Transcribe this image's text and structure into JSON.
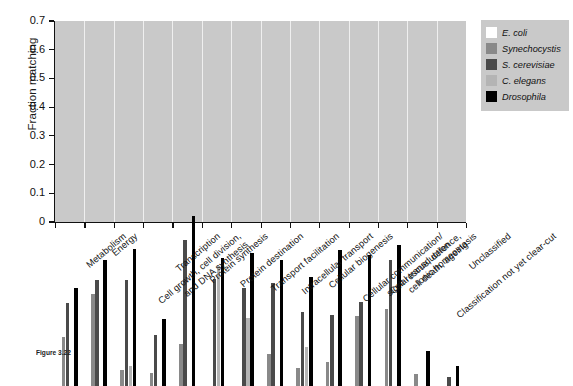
{
  "figure": {
    "caption_label": "Figure 3.22",
    "caption_text": ""
  },
  "legend": {
    "position": "top-right",
    "entries": [
      {
        "label": "E. coli",
        "color": "#ffffff"
      },
      {
        "label": "Synechocystis",
        "color": "#898989"
      },
      {
        "label": "S. cerevisiae",
        "color": "#4a4a4a"
      },
      {
        "label": "C. elegans",
        "color": "#b4b4b4"
      },
      {
        "label": "Drosophila",
        "color": "#000000"
      }
    ]
  },
  "chart_data": {
    "type": "bar",
    "title": "",
    "xlabel": "",
    "ylabel": "Fraction matching",
    "ylim": [
      0,
      0.7
    ],
    "yticks": [
      "0",
      "0.1",
      "0.2",
      "0.3",
      "0.4",
      "0.5",
      "0.6",
      "0.7"
    ],
    "grid": false,
    "legend_position": "top-right",
    "categories": [
      "Metabolism",
      "Energy",
      "Cell growth, cell division,\nand DNA synthesis",
      "Transcription",
      "Protein synthesis",
      "Protein destination",
      "Transport facilitation",
      "Intracellular transport",
      "Cellular biogenesis",
      "Cellular communication/\nsignal transduction",
      "Cell rescue, defence,\ncell death, ageing",
      "Ionic homeostasis",
      "Classification not yet clear-cut",
      "Unclassified"
    ],
    "series": [
      {
        "name": "E. coli",
        "color": "#ffffff",
        "values": [
          0.175,
          0.32,
          0.025,
          0.0,
          0.125,
          0.0,
          0.0,
          0.09,
          0.0,
          0.075,
          0.205,
          0.145,
          0.0,
          0.0
        ]
      },
      {
        "name": "Synechocystis",
        "color": "#898989",
        "values": [
          0.172,
          0.32,
          0.055,
          0.045,
          0.148,
          0.0,
          0.0,
          0.113,
          0.063,
          0.083,
          0.243,
          0.268,
          0.043,
          0.0
        ]
      },
      {
        "name": "S. cerevisiae",
        "color": "#4a4a4a",
        "values": [
          0.288,
          0.368,
          0.368,
          0.178,
          0.508,
          0.373,
          0.343,
          0.36,
          0.258,
          0.248,
          0.293,
          0.44,
          0.0,
          0.033
        ]
      },
      {
        "name": "C. elegans",
        "color": "#b4b4b4",
        "values": [
          0.0,
          0.0,
          0.068,
          0.0,
          0.0,
          0.418,
          0.238,
          0.0,
          0.135,
          0.0,
          0.0,
          0.0,
          0.0,
          0.0
        ]
      },
      {
        "name": "Drosophila",
        "color": "#000000",
        "values": [
          0.34,
          0.44,
          0.477,
          0.233,
          0.592,
          0.445,
          0.463,
          0.44,
          0.38,
          0.473,
          0.455,
          0.49,
          0.123,
          0.068
        ]
      }
    ]
  }
}
